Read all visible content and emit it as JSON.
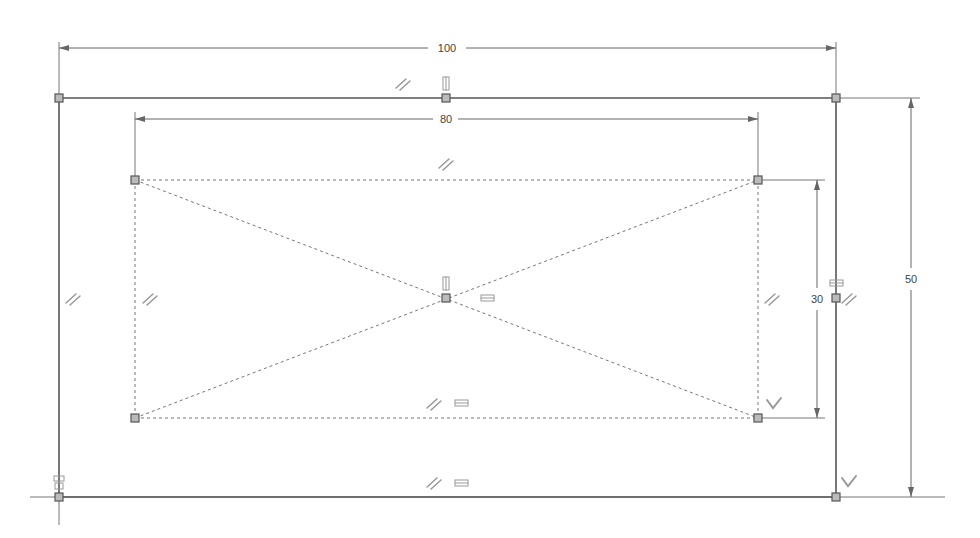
{
  "sketch": {
    "outer_rect": {
      "width_label": "100",
      "height_label": "50"
    },
    "inner_rect": {
      "width_label": "80",
      "height_label": "30",
      "style": "construction-dashed"
    },
    "colors": {
      "geometry": "#555555",
      "construction": "#777777",
      "dimension": "#666666",
      "point_fill": "#bbbbbb",
      "glyph": "#999999",
      "background": "#ffffff"
    },
    "constraints": {
      "parallel": "//",
      "horizontal": "═",
      "vertical": "‖",
      "perpendicular": "⊥"
    }
  }
}
